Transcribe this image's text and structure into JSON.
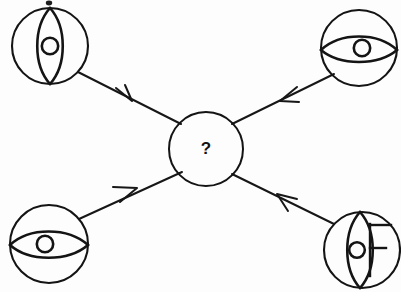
{
  "diagram": {
    "type": "analogy-inference",
    "background_color": "#fdfdfd",
    "ink_color": "#141414",
    "center": {
      "label": "?",
      "name": "unknown-result",
      "cx": 206,
      "cy": 149,
      "r": 37
    },
    "nodes": [
      {
        "id": "top-left",
        "name": "eye-sphere-vertical-top-left",
        "eye_orientation": "vertical",
        "has_pupil": true,
        "letter": "",
        "cx": 50,
        "cy": 46,
        "r": 38
      },
      {
        "id": "top-right",
        "name": "eye-sphere-horizontal-top-right",
        "eye_orientation": "horizontal",
        "has_pupil": true,
        "letter": "",
        "cx": 359,
        "cy": 48,
        "r": 38
      },
      {
        "id": "bottom-left",
        "name": "eye-sphere-horizontal-bottom-left",
        "eye_orientation": "horizontal",
        "has_pupil": true,
        "letter": "",
        "cx": 49,
        "cy": 244,
        "r": 39
      },
      {
        "id": "bottom-right",
        "name": "eye-sphere-vertical-letter-bottom-right",
        "eye_orientation": "vertical",
        "has_pupil": true,
        "letter": "F",
        "cx": 362,
        "cy": 250,
        "r": 38
      }
    ],
    "arrows": [
      {
        "name": "arrow-top-left-to-center",
        "from": "top-left",
        "to": "center",
        "direction": "down-right",
        "x1": 78,
        "y1": 72,
        "x2": 180,
        "y2": 124,
        "head_x": 129,
        "head_y": 98
      },
      {
        "name": "arrow-top-right-to-center",
        "from": "top-right",
        "to": "center",
        "direction": "down-left",
        "x1": 333,
        "y1": 75,
        "x2": 233,
        "y2": 124,
        "head_x": 284,
        "head_y": 100
      },
      {
        "name": "arrow-bottom-left-to-center",
        "from": "bottom-left",
        "to": "center",
        "direction": "up-right",
        "x1": 79,
        "y1": 219,
        "x2": 181,
        "y2": 173,
        "head_x": 134,
        "head_y": 192
      },
      {
        "name": "arrow-bottom-right-to-center",
        "from": "bottom-right",
        "to": "center",
        "direction": "up-left",
        "x1": 334,
        "y1": 224,
        "x2": 233,
        "y2": 175,
        "head_x": 283,
        "head_y": 199
      }
    ],
    "artifacts": [
      {
        "name": "scan-speck-top",
        "x": 49,
        "y": 3,
        "rx": 3,
        "ry": 2
      }
    ]
  }
}
